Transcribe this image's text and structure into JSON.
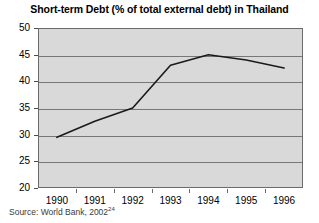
{
  "chart_data": {
    "type": "line",
    "title": "Short-term Debt (% of total external debt) in Thailand",
    "xlabel": "",
    "ylabel": "",
    "categories": [
      "1990",
      "1991",
      "1992",
      "1993",
      "1994",
      "1995",
      "1996"
    ],
    "values": [
      29.5,
      32.5,
      35.0,
      43.0,
      45.0,
      44.0,
      42.5
    ],
    "series": [
      {
        "name": "Short-term Debt (% of total external debt)",
        "values": [
          29.5,
          32.5,
          35.0,
          43.0,
          45.0,
          44.0,
          42.5
        ]
      }
    ],
    "ylim": [
      20,
      50
    ],
    "yticks": [
      20,
      25,
      30,
      35,
      40,
      45,
      50
    ],
    "ytick_labels": [
      "20",
      "25",
      "30",
      "35",
      "40",
      "45",
      "50"
    ],
    "grid": true,
    "grid_axis": "y",
    "legend": false,
    "legend_position": "none",
    "line_color": "#1a1a1a",
    "plot_background": "#d9d9d9",
    "figure_background": "#ffffff",
    "markers": false
  },
  "source": {
    "text": "Source: World Bank, 2002",
    "footnote_marker": "24"
  }
}
